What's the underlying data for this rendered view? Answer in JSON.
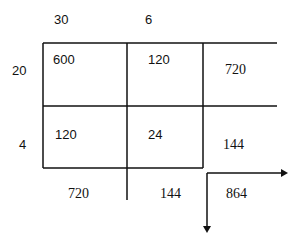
{
  "diagram": {
    "type": "area-model-multiplication",
    "column_headers": [
      "30",
      "6"
    ],
    "row_headers": [
      "20",
      "4"
    ],
    "cells": [
      [
        "600",
        "120"
      ],
      [
        "120",
        "24"
      ]
    ],
    "row_totals": [
      "720",
      "144"
    ],
    "column_totals": [
      "720",
      "144"
    ],
    "grand_total": "864",
    "colors": {
      "line": "#111111",
      "background": "#ffffff"
    }
  }
}
